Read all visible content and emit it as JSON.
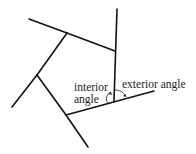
{
  "diagram": {
    "labels": {
      "interior_line1": "interior",
      "interior_line2": "angle",
      "exterior": "exterior angle"
    },
    "line_color": "#111111"
  }
}
